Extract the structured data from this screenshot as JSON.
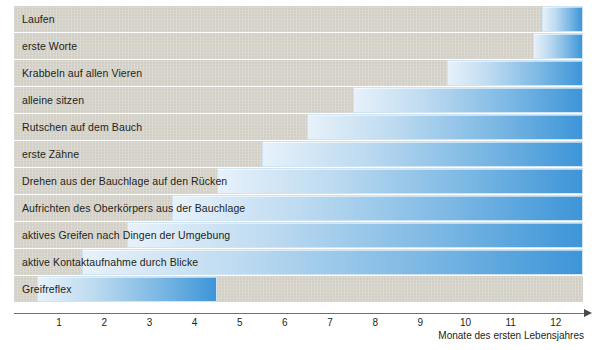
{
  "chart_data": {
    "type": "bar",
    "orientation": "horizontal",
    "title": "",
    "subtitle": "",
    "xlabel": "Monate des ersten Lebensjahres",
    "ylabel": "",
    "xlim": [
      0,
      12.6
    ],
    "xticks": [
      1,
      2,
      3,
      4,
      5,
      6,
      7,
      8,
      9,
      10,
      11,
      12
    ],
    "xtick_labels": [
      "1",
      "2",
      "3",
      "4",
      "5",
      "6",
      "7",
      "8",
      "9",
      "10",
      "11",
      "12"
    ],
    "grid": false,
    "legend": null,
    "note": "Range bars: each milestone spans from its onset month to the right edge of the plot (12.6), except Greifreflex which ends at 4.5.",
    "categories": [
      "Laufen",
      "erste Worte",
      "Krabbeln auf allen Vieren",
      "alleine sitzen",
      "Rutschen auf dem Bauch",
      "erste Zähne",
      "Drehen aus der Bauchlage auf den Rücken",
      "Aufrichten des Oberkörpers aus der Bauchlage",
      "aktives Greifen nach Dingen der Umgebung",
      "aktive Kontaktaufnahme durch Blicke",
      "Greifreflex"
    ],
    "bars": [
      {
        "label": "Laufen",
        "start": 11.7,
        "end": 12.6
      },
      {
        "label": "erste Worte",
        "start": 11.5,
        "end": 12.6
      },
      {
        "label": "Krabbeln auf allen Vieren",
        "start": 9.6,
        "end": 12.6
      },
      {
        "label": "alleine sitzen",
        "start": 7.5,
        "end": 12.6
      },
      {
        "label": "Rutschen auf dem Bauch",
        "start": 6.5,
        "end": 12.6
      },
      {
        "label": "erste Zähne",
        "start": 5.5,
        "end": 12.6
      },
      {
        "label": "Drehen aus der Bauchlage auf den Rücken",
        "start": 4.5,
        "end": 12.6
      },
      {
        "label": "Aufrichten des Oberkörpers aus der Bauchlage",
        "start": 3.5,
        "end": 12.6
      },
      {
        "label": "aktives Greifen nach Dingen der Umgebung",
        "start": 2.5,
        "end": 12.6
      },
      {
        "label": "aktive Kontaktaufnahme durch Blicke",
        "start": 1.5,
        "end": 12.6
      },
      {
        "label": "Greifreflex",
        "start": 0.5,
        "end": 4.5
      }
    ]
  },
  "colors": {
    "band": "#d2d0c6",
    "bar_start": "#e7f1fa",
    "bar_end": "#3d95d8",
    "bar_border": "#cfe3f3",
    "axis": "#6f6f6f",
    "text": "#231f20",
    "background": "#ffffff"
  }
}
